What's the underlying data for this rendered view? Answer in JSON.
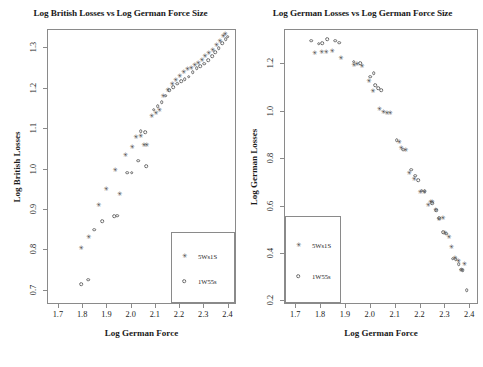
{
  "figure": {
    "width": 483,
    "height": 367,
    "background": "#ffffff",
    "panel_count": 2
  },
  "series_styles": {
    "a": {
      "key": "5Ws1S",
      "marker": "filled-star",
      "color": "#3c3c3c"
    },
    "b": {
      "key": "1W55s",
      "marker": "open-circle",
      "color": "#6b6b6b"
    }
  },
  "chart_data": [
    {
      "id": "left",
      "type": "scatter",
      "title": "Log British Losses vs Log German Force Size",
      "xlabel": "Log German Force",
      "ylabel": "Log British Losses",
      "xlim": [
        1.655,
        2.435
      ],
      "ylim": [
        0.665,
        1.345
      ],
      "xticks": [
        1.7,
        1.8,
        1.9,
        2.0,
        2.1,
        2.2,
        2.3,
        2.4
      ],
      "xticklabels": [
        "1.7",
        "1.8",
        "1.9",
        "2.0",
        "2.1",
        "2.2",
        "2.3",
        "2.4"
      ],
      "yticks": [
        0.7,
        0.8,
        0.9,
        1.0,
        1.1,
        1.2,
        1.3
      ],
      "yticklabels": [
        "0.7",
        "0.8",
        "0.9",
        "1.0",
        "1.1",
        "1.2",
        "1.3"
      ],
      "grid": false,
      "legend": {
        "position": "bottom-right",
        "entries": [
          {
            "label": "5Ws1S",
            "series": "a"
          },
          {
            "label": "1W55s",
            "series": "b"
          }
        ]
      },
      "series": [
        {
          "name": "5Ws1S",
          "style": "a",
          "points": [
            [
              1.79,
              0.807
            ],
            [
              1.82,
              0.833
            ],
            [
              1.862,
              0.912
            ],
            [
              1.893,
              0.951
            ],
            [
              1.93,
              1.0
            ],
            [
              1.948,
              0.939
            ],
            [
              1.972,
              1.035
            ],
            [
              2.0,
              1.056
            ],
            [
              2.015,
              1.08
            ],
            [
              2.035,
              1.083
            ],
            [
              2.048,
              1.06
            ],
            [
              2.06,
              1.06
            ],
            [
              2.08,
              1.133
            ],
            [
              2.098,
              1.14
            ],
            [
              2.112,
              1.148
            ],
            [
              2.128,
              1.183
            ],
            [
              2.148,
              1.196
            ],
            [
              2.165,
              1.212
            ],
            [
              2.18,
              1.222
            ],
            [
              2.196,
              1.232
            ],
            [
              2.212,
              1.24
            ],
            [
              2.228,
              1.248
            ],
            [
              2.243,
              1.252
            ],
            [
              2.258,
              1.258
            ],
            [
              2.272,
              1.264
            ],
            [
              2.288,
              1.272
            ],
            [
              2.3,
              1.28
            ],
            [
              2.316,
              1.288
            ],
            [
              2.332,
              1.296
            ],
            [
              2.348,
              1.308
            ],
            [
              2.362,
              1.318
            ],
            [
              2.376,
              1.33
            ],
            [
              2.384,
              1.336
            ]
          ]
        },
        {
          "name": "1W55s",
          "style": "b",
          "points": [
            [
              1.791,
              0.716
            ],
            [
              1.822,
              0.728
            ],
            [
              1.846,
              0.851
            ],
            [
              1.878,
              0.872
            ],
            [
              1.928,
              0.884
            ],
            [
              1.94,
              0.886
            ],
            [
              1.982,
              0.992
            ],
            [
              2.0,
              0.992
            ],
            [
              2.028,
              1.022
            ],
            [
              2.06,
              1.008
            ],
            [
              2.038,
              1.095
            ],
            [
              2.056,
              1.093
            ],
            [
              2.092,
              1.148
            ],
            [
              2.108,
              1.157
            ],
            [
              2.124,
              1.167
            ],
            [
              2.14,
              1.183
            ],
            [
              2.156,
              1.196
            ],
            [
              2.172,
              1.204
            ],
            [
              2.188,
              1.212
            ],
            [
              2.204,
              1.218
            ],
            [
              2.22,
              1.223
            ],
            [
              2.236,
              1.23
            ],
            [
              2.252,
              1.24
            ],
            [
              2.268,
              1.25
            ],
            [
              2.284,
              1.256
            ],
            [
              2.3,
              1.262
            ],
            [
              2.316,
              1.27
            ],
            [
              2.332,
              1.28
            ],
            [
              2.346,
              1.29
            ],
            [
              2.36,
              1.3
            ],
            [
              2.374,
              1.312
            ],
            [
              2.388,
              1.322
            ],
            [
              2.396,
              1.328
            ]
          ]
        }
      ]
    },
    {
      "id": "right",
      "type": "scatter",
      "title": "Log German Losses vs Log German Force Size",
      "xlabel": "Log German Force",
      "ylabel": "Log German Losses",
      "xlim": [
        1.655,
        2.435
      ],
      "ylim": [
        0.185,
        1.345
      ],
      "xticks": [
        1.7,
        1.8,
        1.9,
        2.0,
        2.1,
        2.2,
        2.3,
        2.4
      ],
      "xticklabels": [
        "1.7",
        "1.8",
        "1.9",
        "2.0",
        "2.1",
        "2.2",
        "2.3",
        "2.4"
      ],
      "yticks": [
        0.2,
        0.4,
        0.6,
        0.8,
        1.0,
        1.2
      ],
      "yticklabels": [
        "0.2",
        "0.4",
        "0.6",
        "0.8",
        "1.0",
        "1.2"
      ],
      "grid": false,
      "legend": {
        "position": "bottom-left",
        "entries": [
          {
            "label": "5Ws1S",
            "series": "a"
          },
          {
            "label": "1W55s",
            "series": "b"
          }
        ]
      },
      "series": [
        {
          "name": "5Ws1S",
          "style": "a",
          "points": [
            [
              1.772,
              1.25
            ],
            [
              1.8,
              1.252
            ],
            [
              1.818,
              1.252
            ],
            [
              1.842,
              1.255
            ],
            [
              1.878,
              1.228
            ],
            [
              1.93,
              1.196
            ],
            [
              1.942,
              1.2
            ],
            [
              1.962,
              1.194
            ],
            [
              1.99,
              1.132
            ],
            [
              2.006,
              1.088
            ],
            [
              2.032,
              1.012
            ],
            [
              2.048,
              1.0
            ],
            [
              2.062,
              0.996
            ],
            [
              2.076,
              0.993
            ],
            [
              2.112,
              0.872
            ],
            [
              2.12,
              0.848
            ],
            [
              2.138,
              0.838
            ],
            [
              2.152,
              0.742
            ],
            [
              2.172,
              0.718
            ],
            [
              2.196,
              0.662
            ],
            [
              2.212,
              0.66
            ],
            [
              2.228,
              0.608
            ],
            [
              2.238,
              0.62
            ],
            [
              2.244,
              0.618
            ],
            [
              2.258,
              0.584
            ],
            [
              2.272,
              0.546
            ],
            [
              2.288,
              0.55
            ],
            [
              2.296,
              0.488
            ],
            [
              2.312,
              0.47
            ],
            [
              2.322,
              0.428
            ],
            [
              2.336,
              0.382
            ],
            [
              2.35,
              0.372
            ],
            [
              2.362,
              0.332
            ],
            [
              2.374,
              0.358
            ]
          ]
        },
        {
          "name": "1W55s",
          "style": "b",
          "points": [
            [
              1.76,
              1.3
            ],
            [
              1.79,
              1.288
            ],
            [
              1.804,
              1.29
            ],
            [
              1.824,
              1.306
            ],
            [
              1.858,
              1.3
            ],
            [
              1.872,
              1.292
            ],
            [
              1.932,
              1.212
            ],
            [
              1.958,
              1.204
            ],
            [
              1.998,
              1.148
            ],
            [
              2.018,
              1.112
            ],
            [
              2.03,
              1.1
            ],
            [
              2.042,
              1.092
            ],
            [
              2.012,
              1.162
            ],
            [
              2.104,
              0.88
            ],
            [
              2.13,
              0.84
            ],
            [
              2.162,
              0.756
            ],
            [
              2.178,
              0.73
            ],
            [
              2.19,
              0.712
            ],
            [
              2.204,
              0.668
            ],
            [
              2.216,
              0.664
            ],
            [
              2.246,
              0.614
            ],
            [
              2.262,
              0.586
            ],
            [
              2.276,
              0.552
            ],
            [
              2.292,
              0.492
            ],
            [
              2.304,
              0.486
            ],
            [
              2.33,
              0.38
            ],
            [
              2.342,
              0.378
            ],
            [
              2.354,
              0.356
            ],
            [
              2.364,
              0.334
            ],
            [
              2.37,
              0.332
            ],
            [
              2.386,
              0.248
            ]
          ]
        }
      ]
    }
  ]
}
